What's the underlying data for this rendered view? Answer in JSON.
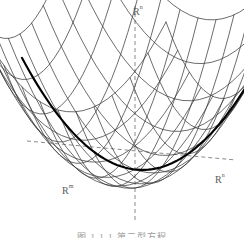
{
  "figure": {
    "caption": "图 1.1.1  第二型方程",
    "background_color": "#ffffff",
    "line_color": "#3b3b3b",
    "bold_curve_color": "#000000",
    "axis_color": "#7a7a7a",
    "label_color": "#5a5a5a"
  },
  "labels": {
    "vertical_axis": {
      "base": "R",
      "sup": "n"
    },
    "left_axis": {
      "base": "R",
      "sup": "m"
    },
    "right_axis": {
      "base": "R",
      "sup": "n"
    }
  },
  "chart_data": {
    "type": "line",
    "title": "",
    "subtitle": "",
    "xlabel": "R",
    "ylabel": "R",
    "plot_kind": "3d-wireframe-paraboloid",
    "surface": {
      "equation": "z = x^2 + y^2",
      "u_range": [
        -1.0,
        1.0
      ],
      "v_range": [
        -1.0,
        1.0
      ],
      "u_lines": 13,
      "v_lines": 13,
      "projection": "oblique",
      "description": "Upward-opening elliptic paraboloid bowl drawn as a wire mesh"
    },
    "annotations": [
      {
        "name": "bold-level-curve",
        "description": "Bold elliptical cross-section curve near the bottom of the bowl",
        "style": "solid-thick"
      },
      {
        "name": "vertical-axis",
        "description": "Dashed vertical axis through the center of the bowl",
        "style": "dashed"
      },
      {
        "name": "horizontal-axis",
        "description": "Dashed horizontal axis running left-right through the bowl",
        "style": "dashed"
      }
    ],
    "axes": [
      {
        "label": "R",
        "sup": "n",
        "position": "top",
        "style": "dashed"
      },
      {
        "label": "R",
        "sup": "m",
        "position": "lower-left",
        "style": "dashed"
      },
      {
        "label": "R",
        "sup": "n",
        "position": "right",
        "style": "dashed"
      }
    ],
    "grid": true,
    "legend": null
  }
}
